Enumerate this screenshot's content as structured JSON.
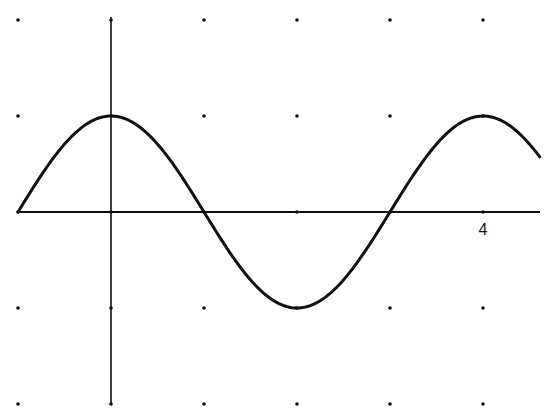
{
  "chart_data": {
    "type": "line",
    "title": "",
    "xlabel": "",
    "ylabel": "",
    "function": "y = cos(pi * x / 2)",
    "xlim": [
      -1,
      4.61
    ],
    "ylim": [
      -2,
      2
    ],
    "grid": "dots",
    "grid_x": [
      -1,
      0,
      1,
      2,
      3,
      4
    ],
    "grid_y": [
      -2,
      -1,
      0,
      1,
      2
    ],
    "tick_labels": [
      {
        "axis": "x",
        "value": 4,
        "label": "4"
      }
    ],
    "series": [
      {
        "name": "curve",
        "x": [
          -1,
          -0.5,
          0,
          0.5,
          1,
          1.5,
          2,
          2.5,
          3,
          3.5,
          4,
          4.5,
          4.61
        ],
        "values": [
          0,
          0.71,
          1,
          0.71,
          0,
          -0.71,
          -1,
          -0.71,
          0,
          0.71,
          1,
          0.71,
          0.57
        ]
      }
    ],
    "legend": null
  },
  "layout": {
    "origin_px": [
      111,
      212
    ],
    "unit_x_px": 93,
    "unit_y_px": 96,
    "x_axis_px": [
      18,
      540
    ],
    "y_axis_px": [
      17,
      404
    ],
    "colors": {
      "line": "#111111",
      "background": "#ffffff"
    }
  },
  "labels": {
    "x_tick_4": "4"
  }
}
